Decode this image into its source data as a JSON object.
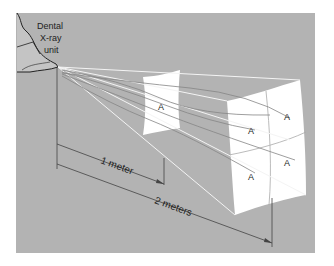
{
  "figure": {
    "background": "#ffffff",
    "panel_color": "#b3b3b3",
    "source_label_lines": [
      "Dental",
      "X-ray",
      "unit"
    ],
    "distance_labels": {
      "near": "1 meter",
      "far": "2 meters"
    },
    "near_screen": {
      "regions": [
        "A"
      ]
    },
    "far_screen": {
      "regions": [
        "A",
        "A",
        "A",
        "A"
      ]
    },
    "colors": {
      "screen": "#ffffff",
      "beam_line": "#f2f2f2",
      "wave_line": "#8a8a8a",
      "outline": "#333333"
    }
  }
}
